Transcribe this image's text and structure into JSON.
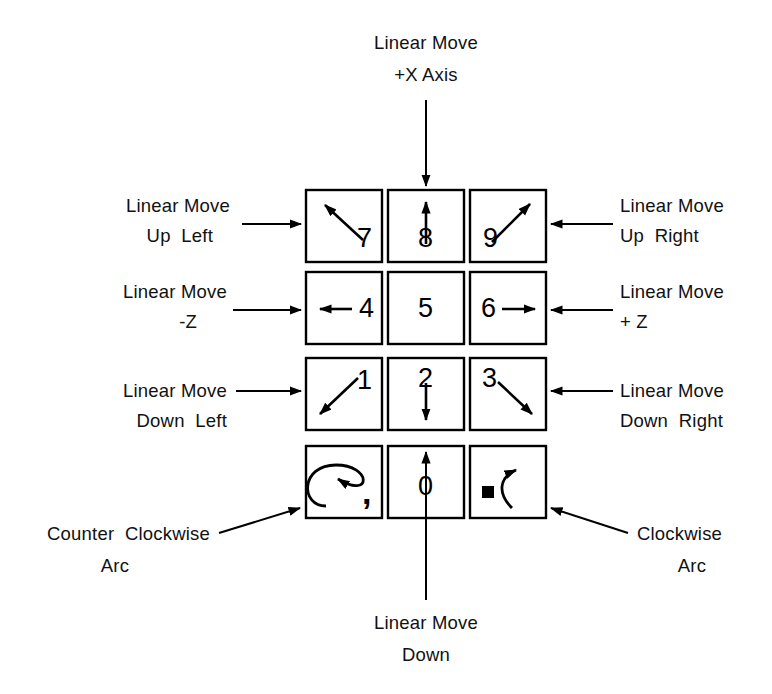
{
  "diagram": {
    "background": "#ffffff",
    "ink": "#000000"
  },
  "keypad": {
    "rows": [
      [
        {
          "key": "7",
          "name": "key-7",
          "arrow": "up-left"
        },
        {
          "key": "8",
          "name": "key-8",
          "arrow": "up"
        },
        {
          "key": "9",
          "name": "key-9",
          "arrow": "up-right"
        }
      ],
      [
        {
          "key": "4",
          "name": "key-4",
          "arrow": "left"
        },
        {
          "key": "5",
          "name": "key-5",
          "arrow": "none"
        },
        {
          "key": "6",
          "name": "key-6",
          "arrow": "right"
        }
      ],
      [
        {
          "key": "1",
          "name": "key-1",
          "arrow": "down-left"
        },
        {
          "key": "2",
          "name": "key-2",
          "arrow": "down"
        },
        {
          "key": "3",
          "name": "key-3",
          "arrow": "down-right"
        }
      ],
      [
        {
          "key": ",",
          "name": "key-comma",
          "arrow": "arc-counter-clockwise"
        },
        {
          "key": "0",
          "name": "key-0",
          "arrow": "none"
        },
        {
          "key": ".",
          "name": "key-period",
          "arrow": "arc-clockwise"
        }
      ]
    ]
  },
  "annotations": {
    "top": {
      "line1": "Linear Move",
      "line2": "+X Axis"
    },
    "left_up": {
      "line1": "Linear Move",
      "line2": "Up  Left"
    },
    "left_mid": {
      "line1": "Linear Move",
      "line2": "-Z"
    },
    "left_down": {
      "line1": "Linear Move",
      "line2": "Down  Left"
    },
    "right_up": {
      "line1": "Linear Move",
      "line2": "Up  Right"
    },
    "right_mid": {
      "line1": "Linear Move",
      "line2": "+ Z"
    },
    "right_down": {
      "line1": "Linear Move",
      "line2": "Down  Right"
    },
    "bottom_left": {
      "line1": "Counter  Clockwise",
      "line2": "Arc"
    },
    "bottom_center": {
      "line1": "Linear Move",
      "line2": "Down"
    },
    "bottom_right": {
      "line1": "Clockwise",
      "line2": "Arc"
    }
  }
}
